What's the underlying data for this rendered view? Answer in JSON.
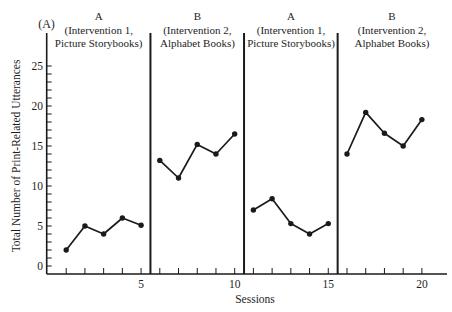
{
  "figure": {
    "panel_label": "(A)",
    "xlabel": "Sessions",
    "ylabel": "Total Number of Print-Related Utterances",
    "phases": [
      {
        "code": "A",
        "line1": "(Intervention 1,",
        "line2": "Picture Storybooks)"
      },
      {
        "code": "B",
        "line1": "(Intervention 2,",
        "line2": "Alphabet Books)"
      },
      {
        "code": "A",
        "line1": "(Intervention 1,",
        "line2": "Picture Storybooks)"
      },
      {
        "code": "B",
        "line1": "(Intervention 2,",
        "line2": "Alphabet Books)"
      }
    ]
  },
  "colors": {
    "background": "#ffffff",
    "ink": "#1a1a1a"
  },
  "chart_data": {
    "type": "line",
    "title": "",
    "panel_label": "(A)",
    "xlabel": "Sessions",
    "ylabel": "Total Number of Print-Related Utterances",
    "xlim": [
      0,
      21
    ],
    "ylim": [
      0,
      25
    ],
    "xticks": [
      5,
      10,
      15,
      20
    ],
    "yticks": [
      0,
      5,
      10,
      15,
      20,
      25
    ],
    "y_minor_tick_step": 1,
    "x_minor_ticks": [
      1,
      2,
      3,
      4,
      5,
      6,
      7,
      8,
      9,
      10,
      11,
      12,
      13,
      14,
      15,
      16,
      17,
      18,
      19,
      20
    ],
    "grid": false,
    "legend": null,
    "phase_change_after_sessions": [
      5,
      10,
      15
    ],
    "series": [
      {
        "name": "A (Intervention 1, Picture Storybooks)",
        "x": [
          1,
          2,
          3,
          4,
          5
        ],
        "values": [
          2,
          5,
          4,
          6,
          5.1
        ]
      },
      {
        "name": "B (Intervention 2, Alphabet Books)",
        "x": [
          6,
          7,
          8,
          9,
          10
        ],
        "values": [
          13.2,
          11,
          15.2,
          14,
          16.5
        ]
      },
      {
        "name": "A (Intervention 1, Picture Storybooks)",
        "x": [
          11,
          12,
          13,
          14,
          15
        ],
        "values": [
          7,
          8.4,
          5.3,
          4,
          5.3
        ]
      },
      {
        "name": "B (Intervention 2, Alphabet Books)",
        "x": [
          16,
          17,
          18,
          19,
          20
        ],
        "values": [
          14,
          19.2,
          16.6,
          15,
          18.3
        ]
      }
    ]
  }
}
